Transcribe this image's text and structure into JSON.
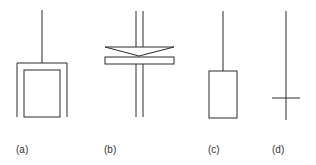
{
  "figure": {
    "panels": [
      {
        "id": "a",
        "label": "(a)",
        "description": "rod with hollow cylinder / cup bob"
      },
      {
        "id": "b",
        "label": "(b)",
        "description": "double rod with cone and plate"
      },
      {
        "id": "c",
        "label": "(c)",
        "description": "rod with solid cylinder bob"
      },
      {
        "id": "d",
        "label": "(d)",
        "description": "rod with cross vane/disk"
      }
    ],
    "colors": {
      "line": "#2a2a2a",
      "background": "#ffffff",
      "text": "#333333"
    }
  }
}
